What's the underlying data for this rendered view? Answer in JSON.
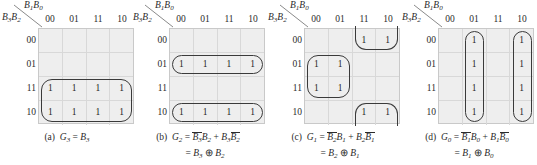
{
  "figure": {
    "type": "karnaugh-map-set",
    "count": 4,
    "axis_labels": {
      "column_variables": "B1B0",
      "row_variables": "B3B2"
    },
    "column_headers": [
      "00",
      "01",
      "11",
      "10"
    ],
    "row_headers": [
      "00",
      "01",
      "11",
      "10"
    ],
    "cell_one": "1",
    "colors": {
      "cell_fill": "#eeeeee",
      "grid_line": "#d8d8d8",
      "grid_border": "#c9c9c9",
      "loop_stroke": "#3a3a3a",
      "text": "#2b2b2b",
      "background": "#ffffff"
    }
  },
  "maps": [
    {
      "id": "a",
      "label": "(a)",
      "output": "G3",
      "cells": [
        [
          "",
          "",
          "",
          ""
        ],
        [
          "",
          "",
          "",
          ""
        ],
        [
          "1",
          "1",
          "1",
          "1"
        ],
        [
          "1",
          "1",
          "1",
          "1"
        ]
      ],
      "groups": [
        {
          "name": "group-rows-11-10-all-cols",
          "rows": [
            2,
            3
          ],
          "cols": [
            0,
            1,
            2,
            3
          ]
        }
      ],
      "equation_1": {
        "lhs": "G3",
        "lhs_base": "G",
        "lhs_sub": "3",
        "rhs_plain": "B3",
        "terms": [
          {
            "literals": [
              {
                "var": "B",
                "sub": "3",
                "bar": false
              }
            ]
          }
        ]
      },
      "equation_2": null
    },
    {
      "id": "b",
      "label": "(b)",
      "output": "G2",
      "cells": [
        [
          "",
          "",
          "",
          ""
        ],
        [
          "1",
          "1",
          "1",
          "1"
        ],
        [
          "",
          "",
          "",
          ""
        ],
        [
          "1",
          "1",
          "1",
          "1"
        ]
      ],
      "groups": [
        {
          "name": "group-row-01-all-cols",
          "rows": [
            1
          ],
          "cols": [
            0,
            1,
            2,
            3
          ]
        },
        {
          "name": "group-row-10-all-cols",
          "rows": [
            3
          ],
          "cols": [
            0,
            1,
            2,
            3
          ]
        }
      ],
      "equation_1": {
        "lhs_base": "G",
        "lhs_sub": "2",
        "terms": [
          {
            "literals": [
              {
                "var": "B",
                "sub": "3",
                "bar": true
              },
              {
                "var": "B",
                "sub": "2",
                "bar": false
              }
            ]
          },
          {
            "literals": [
              {
                "var": "B",
                "sub": "3",
                "bar": false
              },
              {
                "var": "B",
                "sub": "2",
                "bar": true
              }
            ]
          }
        ]
      },
      "equation_2": {
        "operator": "⊕",
        "left": {
          "var": "B",
          "sub": "3"
        },
        "right": {
          "var": "B",
          "sub": "2"
        }
      }
    },
    {
      "id": "c",
      "label": "(c)",
      "output": "G1",
      "cells": [
        [
          "",
          "",
          "1",
          "1"
        ],
        [
          "1",
          "1",
          "",
          ""
        ],
        [
          "1",
          "1",
          "",
          ""
        ],
        [
          "",
          "",
          "1",
          "1"
        ]
      ],
      "groups": [
        {
          "name": "group-row-00-cols-11-10",
          "rows": [
            0
          ],
          "cols": [
            2,
            3
          ],
          "clip": "top"
        },
        {
          "name": "group-rows-01-11-cols-00-01",
          "rows": [
            1,
            2
          ],
          "cols": [
            0,
            1
          ]
        },
        {
          "name": "group-row-10-cols-11-10",
          "rows": [
            3
          ],
          "cols": [
            2,
            3
          ],
          "clip": "bottom"
        }
      ],
      "equation_1": {
        "lhs_base": "G",
        "lhs_sub": "1",
        "terms": [
          {
            "literals": [
              {
                "var": "B",
                "sub": "2",
                "bar": true
              },
              {
                "var": "B",
                "sub": "1",
                "bar": false
              }
            ]
          },
          {
            "literals": [
              {
                "var": "B",
                "sub": "2",
                "bar": false
              },
              {
                "var": "B",
                "sub": "1",
                "bar": true
              }
            ]
          }
        ]
      },
      "equation_2": {
        "operator": "⊕",
        "left": {
          "var": "B",
          "sub": "2"
        },
        "right": {
          "var": "B",
          "sub": "1"
        }
      }
    },
    {
      "id": "d",
      "label": "(d)",
      "output": "G0",
      "cells": [
        [
          "",
          "1",
          "",
          "1"
        ],
        [
          "",
          "1",
          "",
          "1"
        ],
        [
          "",
          "1",
          "",
          "1"
        ],
        [
          "",
          "1",
          "",
          "1"
        ]
      ],
      "groups": [
        {
          "name": "group-col-01-all-rows",
          "rows": [
            0,
            1,
            2,
            3
          ],
          "cols": [
            1
          ]
        },
        {
          "name": "group-col-10-all-rows",
          "rows": [
            0,
            1,
            2,
            3
          ],
          "cols": [
            3
          ]
        }
      ],
      "equation_1": {
        "lhs_base": "G",
        "lhs_sub": "0",
        "terms": [
          {
            "literals": [
              {
                "var": "B",
                "sub": "1",
                "bar": true
              },
              {
                "var": "B",
                "sub": "0",
                "bar": false
              }
            ]
          },
          {
            "literals": [
              {
                "var": "B",
                "sub": "1",
                "bar": false
              },
              {
                "var": "B",
                "sub": "0",
                "bar": true
              }
            ]
          }
        ]
      },
      "equation_2": {
        "operator": "⊕",
        "left": {
          "var": "B",
          "sub": "1"
        },
        "right": {
          "var": "B",
          "sub": "0"
        }
      }
    }
  ]
}
